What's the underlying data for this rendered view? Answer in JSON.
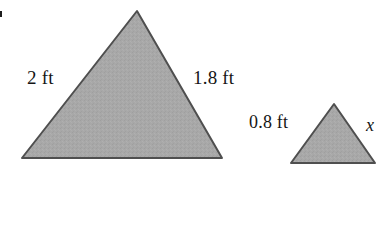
{
  "figure": {
    "background_color": "#ffffff",
    "fill_color": "#a8a8a8",
    "stroke_color": "#4a4a4a",
    "shapes": [
      {
        "name": "large-triangle",
        "type": "triangle",
        "points": "137,11 222,158 22,158"
      },
      {
        "name": "small-triangle",
        "type": "triangle",
        "points": "334,104 375,163 291,163"
      }
    ]
  },
  "labels": {
    "large_left_side": "2 ft",
    "large_right_side": "1.8 ft",
    "small_left_side": "0.8 ft",
    "small_right_side": "x"
  },
  "chart_data": {
    "type": "diagram",
    "shapes": [
      {
        "id": "large-triangle",
        "label": "large triangle",
        "sides": [
          {
            "position": "left",
            "value": "2 ft",
            "number": 2,
            "unit": "ft"
          },
          {
            "position": "right",
            "value": "1.8 ft",
            "number": 1.8,
            "unit": "ft"
          }
        ]
      },
      {
        "id": "small-triangle",
        "label": "small triangle",
        "sides": [
          {
            "position": "left",
            "value": "0.8 ft",
            "number": 0.8,
            "unit": "ft"
          },
          {
            "position": "right",
            "value": "x",
            "number": null,
            "unit": ""
          }
        ]
      }
    ]
  }
}
